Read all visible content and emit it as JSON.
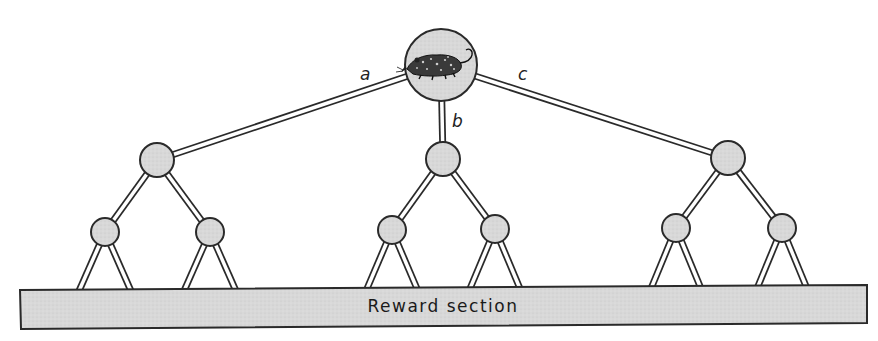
{
  "diagram": {
    "start_node": {
      "icon": "rat-icon",
      "cx": 441,
      "cy": 65,
      "r": 36
    },
    "branch_labels": [
      {
        "text": "a",
        "x": 360,
        "y": 80
      },
      {
        "text": "b",
        "x": 452,
        "y": 127
      },
      {
        "text": "c",
        "x": 518,
        "y": 80
      }
    ],
    "level1_nodes": [
      {
        "id": "left",
        "cx": 157,
        "cy": 160,
        "r": 17
      },
      {
        "id": "middle",
        "cx": 443,
        "cy": 159,
        "r": 17
      },
      {
        "id": "right",
        "cx": 728,
        "cy": 158,
        "r": 17
      }
    ],
    "level2_nodes": [
      {
        "parent": "left",
        "cx": 105,
        "cy": 232,
        "r": 14
      },
      {
        "parent": "left",
        "cx": 210,
        "cy": 232,
        "r": 14
      },
      {
        "parent": "middle",
        "cx": 392,
        "cy": 230,
        "r": 14
      },
      {
        "parent": "middle",
        "cx": 495,
        "cy": 229,
        "r": 14
      },
      {
        "parent": "right",
        "cx": 676,
        "cy": 228,
        "r": 14
      },
      {
        "parent": "right",
        "cx": 782,
        "cy": 228,
        "r": 14
      }
    ],
    "reward_section": {
      "label": "Reward section",
      "fill": "#d9d9d9"
    },
    "colors": {
      "node_fill": "#d6d6d6",
      "stroke": "#2a2a2a",
      "path_fill": "#ffffff",
      "background": "#ffffff"
    }
  }
}
